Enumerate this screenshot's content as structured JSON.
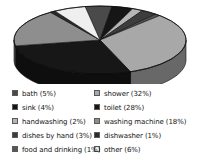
{
  "chart_data": {
    "type": "pie",
    "title": "",
    "subtitle": "",
    "xlabel": "",
    "ylabel": "",
    "three_d": true,
    "grid": false,
    "legend_position": "bottom",
    "legend_columns": 2,
    "value_unit": "%",
    "categories": [
      "bath",
      "sink",
      "handwashing",
      "dishes by hand",
      "food and drinking",
      "shower",
      "toilet",
      "washing machine",
      "dishwasher",
      "other"
    ],
    "values": [
      5,
      4,
      2,
      3,
      1,
      32,
      28,
      18,
      1,
      6
    ],
    "slices": [
      {
        "label": "bath",
        "value": 5,
        "value_text": "5%",
        "legend_text": "bath (5%)",
        "color": "#4a4a4a"
      },
      {
        "label": "sink",
        "value": 4,
        "value_text": "4%",
        "legend_text": "sink (4%)",
        "color": "#161616"
      },
      {
        "label": "handwashing",
        "value": 2,
        "value_text": "2%",
        "legend_text": "handwashing (2%)",
        "color": "#b5b5b5"
      },
      {
        "label": "dishes by hand",
        "value": 3,
        "value_text": "3%",
        "legend_text": "dishes by hand (3%)",
        "color": "#3d3d3d"
      },
      {
        "label": "food and drinking",
        "value": 1,
        "value_text": "1%",
        "legend_text": "food and drinking (1%)",
        "color": "#555555"
      },
      {
        "label": "shower",
        "value": 32,
        "value_text": "32%",
        "legend_text": "shower (32%)",
        "color": "#a8a8a8"
      },
      {
        "label": "toilet",
        "value": 28,
        "value_text": "28%",
        "legend_text": "toilet (28%)",
        "color": "#171717"
      },
      {
        "label": "washing machine",
        "value": 18,
        "value_text": "18%",
        "legend_text": "washing machine (18%)",
        "color": "#8e8e8e"
      },
      {
        "label": "dishwasher",
        "value": 1,
        "value_text": "1%",
        "legend_text": "dishwasher (1%)",
        "color": "#2b2b2b"
      },
      {
        "label": "other",
        "value": 6,
        "value_text": "6%",
        "legend_text": "other (6%)",
        "color": "#efefef"
      }
    ]
  },
  "legend": {
    "left_column": [
      {
        "label": "bath (5%)",
        "color": "#4a4a4a"
      },
      {
        "label": "sink (4%)",
        "color": "#161616"
      },
      {
        "label": "handwashing (2%)",
        "color": "#b5b5b5"
      },
      {
        "label": "dishes by hand (3%)",
        "color": "#3d3d3d"
      },
      {
        "label": "food and drinking (1%)",
        "color": "#555555"
      }
    ],
    "right_column": [
      {
        "label": "shower (32%)",
        "color": "#a8a8a8"
      },
      {
        "label": "toilet (28%)",
        "color": "#171717"
      },
      {
        "label": "washing machine (18%)",
        "color": "#8e8e8e"
      },
      {
        "label": "dishwasher (1%)",
        "color": "#2b2b2b"
      },
      {
        "label": "other (6%)",
        "color": "#efefef"
      }
    ]
  }
}
